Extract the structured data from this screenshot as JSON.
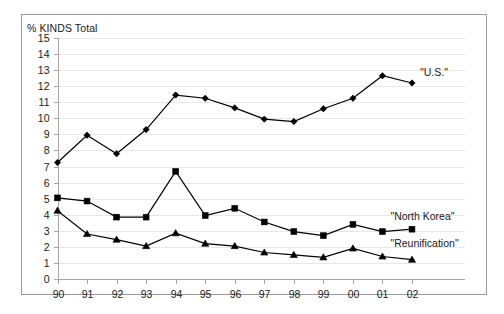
{
  "chart_data": {
    "type": "line",
    "title": "",
    "subtitle": "",
    "xlabel": "",
    "ylabel": "% KINDS Total",
    "ylim": [
      0,
      15
    ],
    "ytick_step": 1,
    "grid": true,
    "legend_position": "right-inline",
    "categories": [
      "90",
      "91",
      "92",
      "93",
      "94",
      "95",
      "96",
      "97",
      "98",
      "99",
      "00",
      "01",
      "02"
    ],
    "ytick_labels": [
      "15",
      "14",
      "13",
      "12",
      "11",
      "10",
      "9",
      "8",
      "7",
      "6",
      "5",
      "4",
      "3",
      "2",
      "1",
      "0"
    ],
    "series": [
      {
        "name": "\"U.S.\"",
        "marker": "diamond",
        "color": "#000000",
        "values": [
          7.25,
          8.95,
          7.8,
          9.3,
          11.45,
          11.25,
          10.65,
          9.95,
          9.8,
          10.6,
          11.25,
          12.65,
          12.2
        ]
      },
      {
        "name": "\"North Korea\"",
        "marker": "square",
        "color": "#000000",
        "values": [
          5.05,
          4.85,
          3.85,
          3.85,
          6.7,
          3.95,
          4.4,
          3.55,
          2.95,
          2.7,
          3.4,
          2.95,
          3.1
        ]
      },
      {
        "name": "\"Reunification\"",
        "marker": "triangle",
        "color": "#000000",
        "values": [
          4.25,
          2.8,
          2.45,
          2.05,
          2.85,
          2.2,
          2.05,
          1.65,
          1.5,
          1.35,
          1.9,
          1.4,
          1.2
        ]
      }
    ],
    "annotations": [
      {
        "text": "\"U.S.\"",
        "x": 12,
        "y": 12.9
      },
      {
        "text": "\"North Korea\"",
        "x": 11,
        "y": 3.95
      },
      {
        "text": "\"Reunification\"",
        "x": 11,
        "y": 2.25
      }
    ]
  }
}
